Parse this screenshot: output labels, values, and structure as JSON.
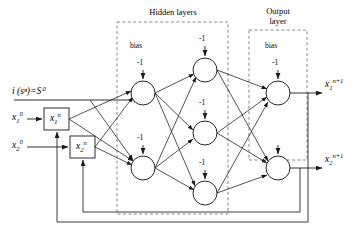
{
  "figure": {
    "type": "neural-network-diagram"
  },
  "sections": {
    "hidden": {
      "title": "Hidden layers"
    },
    "output": {
      "title_line1": "Output",
      "title_line2": "layer"
    }
  },
  "bias": {
    "word": "bias",
    "value": "-1"
  },
  "inputs": {
    "state_label": {
      "text": "i (sⁿ)=S⁰"
    },
    "x1_initial": {
      "base": "x",
      "sub": "1",
      "sup": "0"
    },
    "x2_initial": {
      "base": "x",
      "sub": "2",
      "sup": "0"
    },
    "x1_state_box": {
      "base": "x",
      "sub": "1",
      "sup": "n"
    },
    "x2_state_box": {
      "base": "x",
      "sub": "2",
      "sup": "n"
    }
  },
  "outputs": {
    "y1": {
      "base": "x",
      "sub": "1",
      "sup": "n+1"
    },
    "y2": {
      "base": "x",
      "sub": "2",
      "sup": "n+1"
    }
  },
  "bias_markers": [
    {
      "id": "hidden-col1-node1-bias",
      "value": "-1",
      "x": 140,
      "y": 62
    },
    {
      "id": "hidden-col1-node2-bias",
      "value": "-1",
      "x": 140,
      "y": 137
    },
    {
      "id": "hidden-col2-node1-bias",
      "value": "-1",
      "x": 202,
      "y": 38
    },
    {
      "id": "hidden-col2-node2-bias",
      "value": "-1",
      "x": 202,
      "y": 102
    },
    {
      "id": "hidden-col2-node3-bias",
      "value": "-1",
      "x": 202,
      "y": 162
    },
    {
      "id": "output-node1-bias",
      "value": "-1",
      "x": 275,
      "y": 62
    }
  ],
  "nodes": {
    "hidden_col1": [
      {
        "id": "h1-1",
        "cx": 143,
        "cy": 93,
        "r": 12
      },
      {
        "id": "h1-2",
        "cx": 143,
        "cy": 168,
        "r": 12
      }
    ],
    "hidden_col2": [
      {
        "id": "h2-1",
        "cx": 205,
        "cy": 70,
        "r": 12
      },
      {
        "id": "h2-2",
        "cx": 205,
        "cy": 133,
        "r": 12
      },
      {
        "id": "h2-3",
        "cx": 205,
        "cy": 193,
        "r": 12
      }
    ],
    "output": [
      {
        "id": "o-1",
        "cx": 278,
        "cy": 93,
        "r": 12
      },
      {
        "id": "o-2",
        "cx": 278,
        "cy": 168,
        "r": 12
      }
    ]
  },
  "colors": {
    "stroke": "#1a1a1a",
    "dashed": "#555555",
    "background": "#ffffff"
  }
}
